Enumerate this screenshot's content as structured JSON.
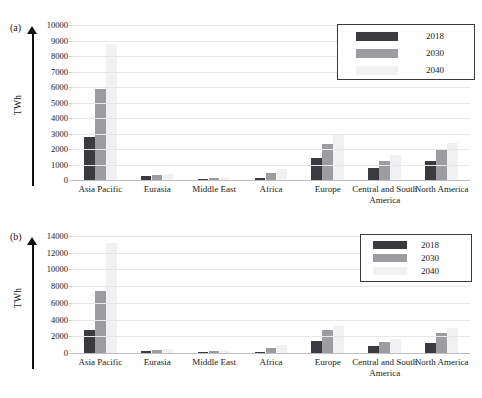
{
  "figure": {
    "panel_a_tag": "(a)",
    "panel_b_tag": "(b)",
    "y_axis_label": "TWh"
  },
  "legend": {
    "entries": [
      {
        "label": "2018",
        "color": "#3b3b3f"
      },
      {
        "label": "2030",
        "color": "#9c9ca1"
      },
      {
        "label": "2040",
        "color": "#f1f1f3"
      }
    ]
  },
  "chart_data": [
    {
      "type": "bar",
      "panel": "(a)",
      "title": "",
      "xlabel": "",
      "ylabel": "TWh",
      "ylim": [
        0,
        10000
      ],
      "ytick_step": 1000,
      "yticks": [
        0,
        1000,
        2000,
        3000,
        4000,
        5000,
        6000,
        7000,
        8000,
        9000,
        10000
      ],
      "grid": true,
      "legend_position": "top-right",
      "categories": [
        "Asia Pacific",
        "Eurasia",
        "Middle East",
        "Africa",
        "Europe",
        "Central and South America",
        "North America"
      ],
      "series": [
        {
          "name": "2018",
          "color": "#3b3b3f",
          "values": [
            2750,
            240,
            40,
            150,
            1400,
            800,
            1200
          ]
        },
        {
          "name": "2030",
          "color": "#9c9ca1",
          "values": [
            5870,
            330,
            110,
            450,
            2350,
            1230,
            1980
          ]
        },
        {
          "name": "2040",
          "color": "#f1f1f3",
          "values": [
            8800,
            400,
            180,
            700,
            2900,
            1600,
            2400
          ]
        }
      ]
    },
    {
      "type": "bar",
      "panel": "(b)",
      "title": "",
      "xlabel": "",
      "ylabel": "TWh",
      "ylim": [
        0,
        14000
      ],
      "ytick_step": 2000,
      "yticks": [
        0,
        2000,
        4000,
        6000,
        8000,
        10000,
        12000,
        14000
      ],
      "grid": true,
      "legend_position": "top-right",
      "categories": [
        "Asia Pacific",
        "Eurasia",
        "Middle East",
        "Africa",
        "Europe",
        "Central and South America",
        "North America"
      ],
      "series": [
        {
          "name": "2018",
          "color": "#3b3b3f",
          "values": [
            2800,
            250,
            40,
            150,
            1400,
            820,
            1220
          ]
        },
        {
          "name": "2030",
          "color": "#9c9ca1",
          "values": [
            7400,
            420,
            200,
            650,
            2700,
            1270,
            2450
          ]
        },
        {
          "name": "2040",
          "color": "#f1f1f3",
          "values": [
            13200,
            520,
            260,
            900,
            3200,
            1700,
            3000
          ]
        }
      ]
    }
  ]
}
